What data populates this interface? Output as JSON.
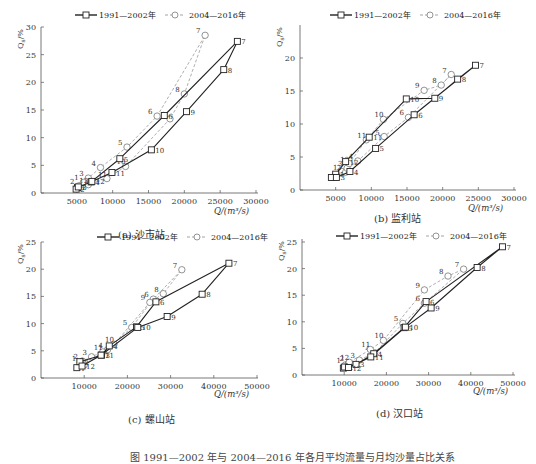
{
  "legend": {
    "series1": "1991—2002年",
    "series2": "2004—2016年"
  },
  "figure_caption": "图 1991—2002 年与 2004—2016 年各月平均流量与月均沙量占比关系",
  "chart_data": [
    {
      "id": "a",
      "type": "line",
      "title": "(a) 沙市站",
      "xlabel": "Q/(m³/s)",
      "ylabel": "Q_s/%",
      "xlim": [
        0,
        30000
      ],
      "ylim": [
        0,
        30
      ],
      "xticks": [
        5000,
        10000,
        15000,
        20000,
        25000,
        30000
      ],
      "yticks": [
        0,
        5,
        10,
        15,
        20,
        25,
        30
      ],
      "grid": false,
      "legend_position": "top",
      "series": [
        {
          "name": "1991—2002年",
          "style": "solid-square",
          "points": [
            {
              "m": 1,
              "x": 5100,
              "y": 1.0
            },
            {
              "m": 2,
              "x": 4900,
              "y": 0.7
            },
            {
              "m": 3,
              "x": 5200,
              "y": 1.1
            },
            {
              "m": 4,
              "x": 7000,
              "y": 2.0
            },
            {
              "m": 5,
              "x": 11000,
              "y": 6.2
            },
            {
              "m": 6,
              "x": 17200,
              "y": 14.0
            },
            {
              "m": 7,
              "x": 27400,
              "y": 27.4
            },
            {
              "m": 8,
              "x": 25500,
              "y": 22.3
            },
            {
              "m": 9,
              "x": 20300,
              "y": 14.7
            },
            {
              "m": 10,
              "x": 15400,
              "y": 7.8
            },
            {
              "m": 11,
              "x": 9900,
              "y": 3.7
            },
            {
              "m": 12,
              "x": 7100,
              "y": 2.1
            }
          ]
        },
        {
          "name": "2004—2016年",
          "style": "dashed-circle",
          "points": [
            {
              "m": 1,
              "x": 5900,
              "y": 1.9
            },
            {
              "m": 2,
              "x": 5300,
              "y": 1.3
            },
            {
              "m": 3,
              "x": 6600,
              "y": 2.7
            },
            {
              "m": 4,
              "x": 8300,
              "y": 4.6
            },
            {
              "m": 5,
              "x": 12000,
              "y": 8.3
            },
            {
              "m": 6,
              "x": 16200,
              "y": 13.9
            },
            {
              "m": 7,
              "x": 22900,
              "y": 28.5
            },
            {
              "m": 8,
              "x": 20000,
              "y": 17.9
            },
            {
              "m": 9,
              "x": 18000,
              "y": 13.4
            },
            {
              "m": 10,
              "x": 11800,
              "y": 4.8
            },
            {
              "m": 11,
              "x": 9200,
              "y": 2.6
            },
            {
              "m": 12,
              "x": 6600,
              "y": 1.5
            }
          ]
        }
      ]
    },
    {
      "id": "b",
      "type": "line",
      "title": "(b) 监利站",
      "xlabel": "Q/(m³/s)",
      "ylabel": "Q_s/%",
      "xlim": [
        0,
        30000
      ],
      "ylim": [
        0,
        25
      ],
      "xticks": [
        5000,
        10000,
        15000,
        20000,
        25000,
        30000
      ],
      "yticks": [
        0,
        5,
        10,
        15,
        20
      ],
      "grid": false,
      "legend_position": "top",
      "series": [
        {
          "name": "1991—2002年",
          "style": "solid-square",
          "points": [
            {
              "m": 1,
              "x": 5000,
              "y": 2.4
            },
            {
              "m": 2,
              "x": 4400,
              "y": 1.9
            },
            {
              "m": 3,
              "x": 5100,
              "y": 1.9
            },
            {
              "m": 4,
              "x": 7000,
              "y": 2.8
            },
            {
              "m": 5,
              "x": 10600,
              "y": 6.3
            },
            {
              "m": 6,
              "x": 16000,
              "y": 11.4
            },
            {
              "m": 7,
              "x": 24600,
              "y": 18.9
            },
            {
              "m": 8,
              "x": 22100,
              "y": 16.8
            },
            {
              "m": 9,
              "x": 18900,
              "y": 13.9
            },
            {
              "m": 10,
              "x": 14900,
              "y": 13.8
            },
            {
              "m": 11,
              "x": 9700,
              "y": 8.0
            },
            {
              "m": 12,
              "x": 6400,
              "y": 4.3
            }
          ]
        },
        {
          "name": "2004—2016年",
          "style": "dashed-circle",
          "points": [
            {
              "m": 1,
              "x": 5900,
              "y": 2.8
            },
            {
              "m": 2,
              "x": 6400,
              "y": 2.7
            },
            {
              "m": 3,
              "x": 6600,
              "y": 3.3
            },
            {
              "m": 4,
              "x": 8100,
              "y": 4.4
            },
            {
              "m": 5,
              "x": 11800,
              "y": 8.1
            },
            {
              "m": 6,
              "x": 15200,
              "y": 11.0
            },
            {
              "m": 7,
              "x": 21200,
              "y": 17.5
            },
            {
              "m": 8,
              "x": 19800,
              "y": 15.9
            },
            {
              "m": 9,
              "x": 17400,
              "y": 15.1
            },
            {
              "m": 10,
              "x": 11700,
              "y": 10.7
            },
            {
              "m": 11,
              "x": 9300,
              "y": 7.6
            },
            {
              "m": 12,
              "x": 6900,
              "y": 4.0
            }
          ]
        }
      ]
    },
    {
      "id": "c",
      "type": "line",
      "title": "(c) 螺山站",
      "xlabel": "Q/(m³/s)",
      "ylabel": "Q_s/%",
      "xlim": [
        0,
        50000
      ],
      "ylim": [
        0,
        25
      ],
      "xticks": [
        10000,
        20000,
        30000,
        40000,
        50000
      ],
      "yticks": [
        0,
        5,
        10,
        15,
        20,
        25
      ],
      "grid": false,
      "legend_position": "top",
      "series": [
        {
          "name": "1991—2002年",
          "style": "solid-square",
          "points": [
            {
              "m": 1,
              "x": 8300,
              "y": 1.9
            },
            {
              "m": 2,
              "x": 9000,
              "y": 3.0
            },
            {
              "m": 3,
              "x": 14000,
              "y": 4.2
            },
            {
              "m": 4,
              "x": 15800,
              "y": 5.9
            },
            {
              "m": 5,
              "x": 22100,
              "y": 9.4
            },
            {
              "m": 6,
              "x": 26600,
              "y": 14.0
            },
            {
              "m": 7,
              "x": 43500,
              "y": 21.1
            },
            {
              "m": 8,
              "x": 37300,
              "y": 15.4
            },
            {
              "m": 9,
              "x": 29200,
              "y": 11.3
            },
            {
              "m": 10,
              "x": 22400,
              "y": 9.3
            },
            {
              "m": 11,
              "x": 13900,
              "y": 4.2
            },
            {
              "m": 12,
              "x": 9500,
              "y": 2.2
            }
          ]
        },
        {
          "name": "2004—2016年",
          "style": "dashed-circle",
          "points": [
            {
              "m": 1,
              "x": 9200,
              "y": 2.8
            },
            {
              "m": 2,
              "x": 9600,
              "y": 3.1
            },
            {
              "m": 3,
              "x": 11700,
              "y": 3.9
            },
            {
              "m": 4,
              "x": 15400,
              "y": 5.2
            },
            {
              "m": 5,
              "x": 21000,
              "y": 9.3
            },
            {
              "m": 6,
              "x": 26000,
              "y": 14.5
            },
            {
              "m": 7,
              "x": 32600,
              "y": 19.9
            },
            {
              "m": 8,
              "x": 28300,
              "y": 15.5
            },
            {
              "m": 9,
              "x": 25200,
              "y": 13.9
            },
            {
              "m": 10,
              "x": 16900,
              "y": 6.2
            },
            {
              "m": 11,
              "x": 14300,
              "y": 4.8
            },
            {
              "m": 12,
              "x": 10000,
              "y": 2.4
            }
          ]
        }
      ]
    },
    {
      "id": "d",
      "type": "line",
      "title": "(d) 汉口站",
      "xlabel": "Q/(m³/s)",
      "ylabel": "Q_s/%",
      "xlim": [
        0,
        50000
      ],
      "ylim": [
        0,
        25
      ],
      "xticks": [
        10000,
        20000,
        30000,
        40000,
        50000
      ],
      "yticks": [
        0,
        5,
        10,
        15,
        20,
        25
      ],
      "grid": false,
      "legend_position": "top",
      "series": [
        {
          "name": "1991—2002年",
          "style": "solid-square",
          "points": [
            {
              "m": 1,
              "x": 9800,
              "y": 1.3
            },
            {
              "m": 2,
              "x": 10100,
              "y": 1.5
            },
            {
              "m": 3,
              "x": 12800,
              "y": 2.0
            },
            {
              "m": 4,
              "x": 17000,
              "y": 4.0
            },
            {
              "m": 5,
              "x": 24200,
              "y": 8.9
            },
            {
              "m": 6,
              "x": 29400,
              "y": 13.8
            },
            {
              "m": 7,
              "x": 47500,
              "y": 24.1
            },
            {
              "m": 8,
              "x": 41500,
              "y": 20.2
            },
            {
              "m": 9,
              "x": 30600,
              "y": 12.6
            },
            {
              "m": 10,
              "x": 24500,
              "y": 9.0
            },
            {
              "m": 11,
              "x": 16300,
              "y": 3.4
            },
            {
              "m": 12,
              "x": 11000,
              "y": 1.4
            }
          ]
        },
        {
          "name": "2004—2016年",
          "style": "dashed-circle",
          "points": [
            {
              "m": 1,
              "x": 10300,
              "y": 1.9
            },
            {
              "m": 2,
              "x": 11000,
              "y": 2.2
            },
            {
              "m": 3,
              "x": 13600,
              "y": 2.8
            },
            {
              "m": 4,
              "x": 17200,
              "y": 4.2
            },
            {
              "m": 5,
              "x": 23900,
              "y": 9.7
            },
            {
              "m": 6,
              "x": 29000,
              "y": 13.5
            },
            {
              "m": 7,
              "x": 38300,
              "y": 19.9
            },
            {
              "m": 8,
              "x": 34600,
              "y": 18.6
            },
            {
              "m": 9,
              "x": 29000,
              "y": 16.0
            },
            {
              "m": 10,
              "x": 19300,
              "y": 6.5
            },
            {
              "m": 11,
              "x": 16200,
              "y": 4.8
            },
            {
              "m": 12,
              "x": 11200,
              "y": 2.4
            }
          ]
        }
      ]
    }
  ]
}
